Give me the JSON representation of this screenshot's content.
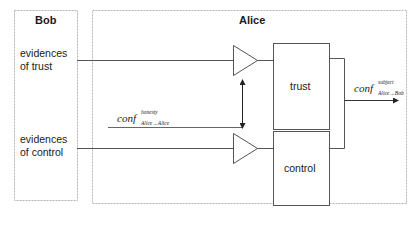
{
  "diagram": {
    "actors": {
      "bob": {
        "title": "Bob"
      },
      "alice": {
        "title": "Alice"
      }
    },
    "inputs": {
      "trust_evidence": {
        "line1": "evidences",
        "line2": "of trust"
      },
      "control_evidence": {
        "line1": "evidences",
        "line2": "of control"
      }
    },
    "blocks": {
      "trust": {
        "label": "trust"
      },
      "control": {
        "label": "control"
      }
    },
    "signals": {
      "honesty": {
        "base": "conf",
        "sup": "honesty",
        "sub": "Alice→Alice"
      },
      "output": {
        "base": "conf",
        "sup": "subject",
        "sub": "Alice→Bob"
      }
    },
    "colors": {
      "line": "#555555",
      "dashed_border": "#b0b0b0",
      "text": "#1a1a1a",
      "background": "#ffffff"
    }
  }
}
